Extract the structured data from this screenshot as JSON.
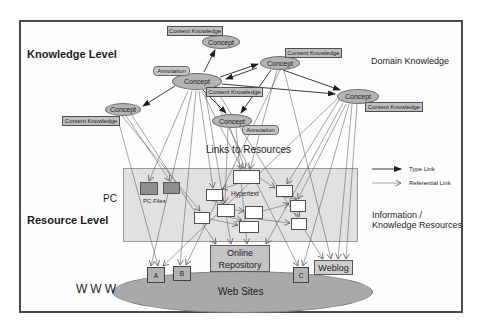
{
  "levels": {
    "knowledge": "Knowledge Level",
    "resource": "Resource Level"
  },
  "regions": {
    "domain_knowledge": "Domain Knowledge",
    "links_to_resources": "Links to Resources",
    "information_knowledge": [
      "Information /",
      "Knowledge Resources"
    ],
    "www": "WWW",
    "pc": "PC"
  },
  "nodes": {
    "concept": "Concept",
    "content_knowledge": "Content Knowledge",
    "annotation": "Annotation",
    "pc_files": "PC Files",
    "hypertext": "Hypertext",
    "online_repository": [
      "Online",
      "Repository"
    ],
    "weblog": "Weblog",
    "web_sites": "Web Sites",
    "site_a": "A",
    "site_b": "B",
    "site_c": "C"
  },
  "legend": {
    "type_link": "Type Link",
    "referential_link": "Referential Link"
  },
  "colors": {
    "concept_fill": "#b4b4b4",
    "panel_fill": "#c9c9c9",
    "websites_fill": "#a9a9a9",
    "pcfile_fill": "#8f8f8f",
    "type_link_line": "#262626",
    "referential_link_line": "#5a5a5a",
    "frame_border": "#4a4a4a"
  }
}
